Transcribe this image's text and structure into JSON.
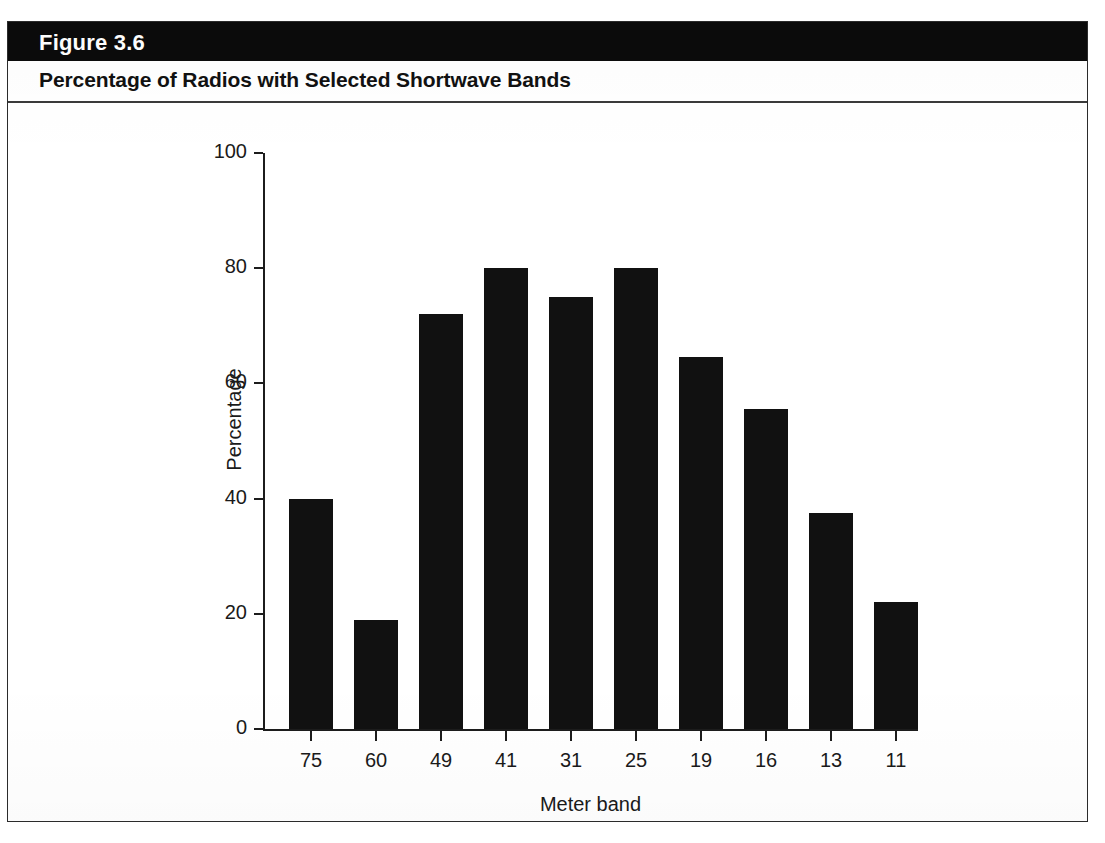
{
  "figure": {
    "number_label": "Figure 3.6",
    "title": "Percentage of Radios with Selected Shortwave Bands",
    "band_color": "#0b0b0b",
    "bar_color": "#111111",
    "frame_color": "#2b2b2b"
  },
  "chart_data": {
    "type": "bar",
    "title": "Percentage of Radios with Selected Shortwave Bands",
    "xlabel": "Meter band",
    "ylabel": "Percentage",
    "categories": [
      "75",
      "60",
      "49",
      "41",
      "31",
      "25",
      "19",
      "16",
      "13",
      "11"
    ],
    "values": [
      40,
      19,
      72,
      80,
      75,
      80,
      64.5,
      55.5,
      37.5,
      22
    ],
    "ylim": [
      0,
      100
    ],
    "yticks": [
      0,
      20,
      40,
      60,
      80,
      100
    ],
    "ytick_labels": [
      "0",
      "20",
      "40",
      "60",
      "80",
      "100"
    ],
    "grid": false,
    "legend": "none",
    "series": [
      {
        "name": "Percentage of radios",
        "values": [
          40,
          19,
          72,
          80,
          75,
          80,
          64.5,
          55.5,
          37.5,
          22
        ]
      }
    ]
  }
}
